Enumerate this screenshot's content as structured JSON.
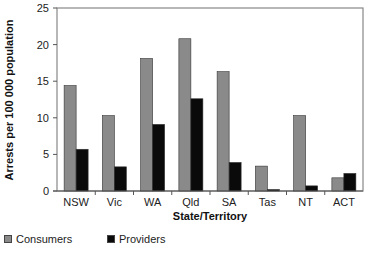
{
  "chart_data": {
    "type": "bar",
    "title": "",
    "xlabel": "State/Territory",
    "ylabel": "Arrests per 100 000 population",
    "ylim": [
      0,
      25
    ],
    "yticks": [
      0,
      5,
      10,
      15,
      20,
      25
    ],
    "grid": false,
    "legend_position": "bottom-left",
    "categories": [
      "NSW",
      "Vic",
      "WA",
      "Qld",
      "SA",
      "Tas",
      "NT",
      "ACT"
    ],
    "series": [
      {
        "name": "Consumers",
        "color": "#8a8a8a",
        "values": [
          14.4,
          10.3,
          18.1,
          20.8,
          16.3,
          3.4,
          10.3,
          1.8
        ]
      },
      {
        "name": "Providers",
        "color": "#0a0a0a",
        "values": [
          5.7,
          3.3,
          9.1,
          12.6,
          3.9,
          0.2,
          0.7,
          2.4
        ]
      }
    ]
  },
  "legend": {
    "items": [
      {
        "label": "Consumers",
        "color": "#8a8a8a"
      },
      {
        "label": "Providers",
        "color": "#0a0a0a"
      }
    ]
  }
}
